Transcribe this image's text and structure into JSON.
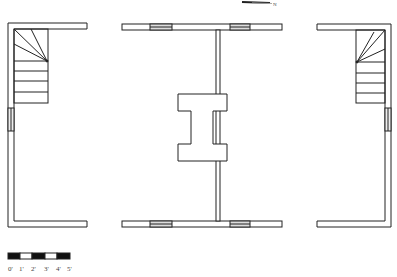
{
  "diagram": {
    "type": "architectural-floor-plan",
    "line_color": "#222222",
    "window_fill": "#dddddd",
    "sections": [
      {
        "name": "left-wing",
        "features": [
          "staircase-winder",
          "side-window"
        ]
      },
      {
        "name": "central-hall",
        "features": [
          "top-windows-2",
          "bottom-windows-2",
          "center-partition",
          "h-shaped-chimney"
        ]
      },
      {
        "name": "right-wing",
        "features": [
          "staircase-winder",
          "side-window"
        ]
      }
    ],
    "north_arrow": {
      "label": "N"
    }
  },
  "scale_bar": {
    "labels": [
      "0'",
      "1'",
      "2'",
      "3'",
      "4'",
      "5'"
    ]
  }
}
